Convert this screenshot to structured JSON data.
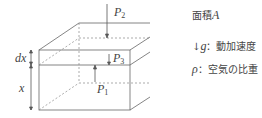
{
  "diagram": {
    "labels": {
      "p2": {
        "sym": "P",
        "sub": "2"
      },
      "p3": {
        "sym": "P",
        "sub": "3"
      },
      "p1": {
        "sym": "P",
        "sub": "1"
      },
      "dx": "dx",
      "x": "x"
    },
    "legend": {
      "area": {
        "text": "面積",
        "sym": "A"
      },
      "gravity": {
        "arrow": "↓",
        "sym": "g",
        "text": "：動加速度"
      },
      "density": {
        "sym": "ρ",
        "text": "：空気の比重"
      }
    }
  }
}
